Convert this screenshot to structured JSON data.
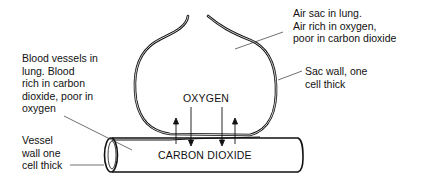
{
  "diagram": {
    "labels": {
      "air_sac": "Air sac in lung.\nAir rich in oxygen,\npoor in carbon dioxide",
      "sac_wall": "Sac wall, one\ncell thick",
      "blood_vessels": "Blood vessels in\nlung. Blood\nrich in carbon\ndioxide, poor in\noxygen",
      "vessel_wall": "Vessel\nwall one\ncell thick",
      "oxygen": "OXYGEN",
      "carbon_dioxide": "CARBON DIOXIDE"
    },
    "arrows": [
      {
        "gas": "carbon_dioxide",
        "direction": "up"
      },
      {
        "gas": "oxygen",
        "direction": "down"
      },
      {
        "gas": "oxygen",
        "direction": "down"
      },
      {
        "gas": "carbon_dioxide",
        "direction": "up"
      }
    ],
    "colors": {
      "line": "#111111",
      "background": "#ffffff"
    }
  }
}
